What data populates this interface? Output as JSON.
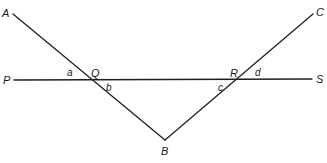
{
  "diagram": {
    "type": "geometry",
    "colors": {
      "line": "#1f1f1f",
      "text": "#1a1a1a",
      "background": "#ffffff"
    },
    "points": {
      "A": {
        "label": "A",
        "x": 13,
        "y": 14
      },
      "C": {
        "label": "C",
        "x": 313,
        "y": 14
      },
      "P": {
        "label": "P",
        "x": 14,
        "y": 80
      },
      "S": {
        "label": "S",
        "x": 312,
        "y": 79
      },
      "Q": {
        "label": "Q",
        "x": 89,
        "y": 80
      },
      "R": {
        "label": "R",
        "x": 238,
        "y": 79
      },
      "B": {
        "label": "B",
        "x": 165,
        "y": 140
      }
    },
    "angles": {
      "a": {
        "label": "a"
      },
      "b": {
        "label": "b"
      },
      "c": {
        "label": "c"
      },
      "d": {
        "label": "d"
      }
    },
    "segments": [
      {
        "name": "line-PS",
        "from": "P",
        "to": "S"
      },
      {
        "name": "line-AB",
        "from": "A",
        "to": "B"
      },
      {
        "name": "line-BC",
        "from": "B",
        "to": "C"
      }
    ]
  }
}
